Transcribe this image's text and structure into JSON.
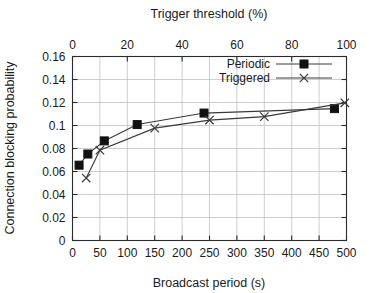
{
  "chart_data": {
    "type": "line",
    "title": "",
    "xlabel": "Broadcast period (s)",
    "ylabel": "Connection blocking probability",
    "x2label": "Trigger threshold (%)",
    "xlim": [
      0,
      500
    ],
    "ylim": [
      0,
      0.16
    ],
    "x2lim": [
      0,
      100
    ],
    "xticks": [
      0,
      50,
      100,
      150,
      200,
      250,
      300,
      350,
      400,
      450,
      500
    ],
    "xtick_labels": [
      "0",
      "50",
      "100",
      "150",
      "200",
      "250",
      "300",
      "350",
      "400",
      "450",
      "500"
    ],
    "yticks": [
      0,
      0.02,
      0.04,
      0.06,
      0.08,
      0.1,
      0.12,
      0.14,
      0.16
    ],
    "ytick_labels": [
      "0",
      "0.02",
      "0.04",
      "0.06",
      "0.08",
      "0.1",
      "0.12",
      "0.14",
      "0.16"
    ],
    "x2ticks": [
      0,
      20,
      40,
      60,
      80,
      100
    ],
    "x2tick_labels": [
      "0",
      "20",
      "40",
      "60",
      "80",
      "100"
    ],
    "grid": true,
    "legend_position": "top-right",
    "series": [
      {
        "name": "Periodic",
        "marker": "filled-square",
        "x": [
          12,
          28,
          58,
          118,
          240,
          478
        ],
        "y": [
          0.0655,
          0.0752,
          0.0866,
          0.1008,
          0.1108,
          0.1147
        ]
      },
      {
        "name": "Triggered",
        "marker": "cross-x",
        "x": [
          25,
          50,
          150,
          250,
          350,
          497
        ],
        "y": [
          0.0543,
          0.0785,
          0.0977,
          0.1047,
          0.1077,
          0.1197
        ]
      }
    ]
  },
  "legend": {
    "entries": [
      {
        "label": "Periodic"
      },
      {
        "label": "Triggered"
      }
    ]
  },
  "colors": {
    "line": "#3a3a3a",
    "marker": "#111111",
    "grid": "#b9b9b9",
    "frame": "#2b2b2b",
    "background": "#ffffff"
  }
}
